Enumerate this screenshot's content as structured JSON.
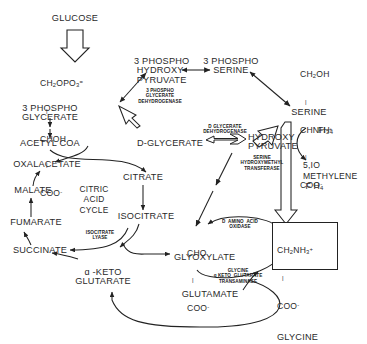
{
  "diagram": {
    "type": "biochemical-pathway",
    "stroke_color": "#222222",
    "text_color": "#2a2a2a",
    "background": "#ffffff"
  },
  "metabolites": {
    "glucose": "GLUCOSE",
    "phosphoglycerate": "3 PHOSPHO\nGLYCERATE",
    "phosphohydroxypyruvate": "3 PHOSPHO\nHYDROXY\nPYRUVATE",
    "phosphoserine": "3 PHOSPHO\nSERINE",
    "serine": "SERINE",
    "acetyl_coa": "ACETYL COA",
    "d_glycerate": "D-GLYCERATE",
    "hydroxypyruvate": "HYDROXY\nPYRUVATE",
    "fh4": "FH",
    "fh4_sub": "4",
    "methylene_fh4": "5,IO\nMETHYLENE\nF H",
    "methylene_fh4_sub": "4",
    "oxalacetate": "OXALACETATE",
    "malate": "MALATE",
    "fumarate": "FUMARATE",
    "succinate": "SUCCINATE",
    "citrate": "CITRATE",
    "isocitrate": "ISOCITRATE",
    "alpha_keto_glutarate": "α -KETO\nGLUTARATE",
    "glyoxylate": "GLYOXYLATE",
    "glycine": "GLYCINE",
    "glutamate": "GLUTAMATE",
    "citric_acid_cycle": "CITRIC\nACID\nCYCLE"
  },
  "structures": {
    "phosphoglycerate": {
      "line1": "CH",
      "line1_sub": "2",
      "line1_rest": "OPO",
      "line1_sub2": "3",
      "line1_sup": "=",
      "line2": "CHOH",
      "line3": "COO",
      "line3_sup": "-"
    },
    "serine": {
      "line1": "CH",
      "line1_sub": "2",
      "line1_rest": "OH",
      "line2": "CHNH",
      "line2_sub": "3",
      "line2_sup": "+",
      "line3": "COO",
      "line3_sup": "-"
    },
    "glyoxylate": {
      "line1": "CHO",
      "line2": "COO",
      "line2_sup": "-"
    },
    "glycine": {
      "line1": "CH",
      "line1_sub": "2",
      "line1_rest": "NH",
      "line1_sub2": "3",
      "line1_sup": "+",
      "line2": "COO",
      "line2_sup": "-",
      "line3": "GLYCINE"
    }
  },
  "enzymes": {
    "pg_dehydrogenase": "3 PHOSPHO\nGLYCERATE\nDEHYDROGENASE",
    "glycerate_dehydrogenase": "D GLYCERATE\nDEHYDROGENASE",
    "serine_hydroxymethyl_transferase": "SERINE\nHYDROXYMETHYL\nTRANSFERASE",
    "d_amino_acid_oxidase": "D  AMINO  ACID\nOXIDASE",
    "glycine_transaminase": "GLYCINE\nα KETO  GLUTARATE\nTRANSAMINASE",
    "isocitrate_lyase": "ISOCITRATE\nLYASE"
  }
}
